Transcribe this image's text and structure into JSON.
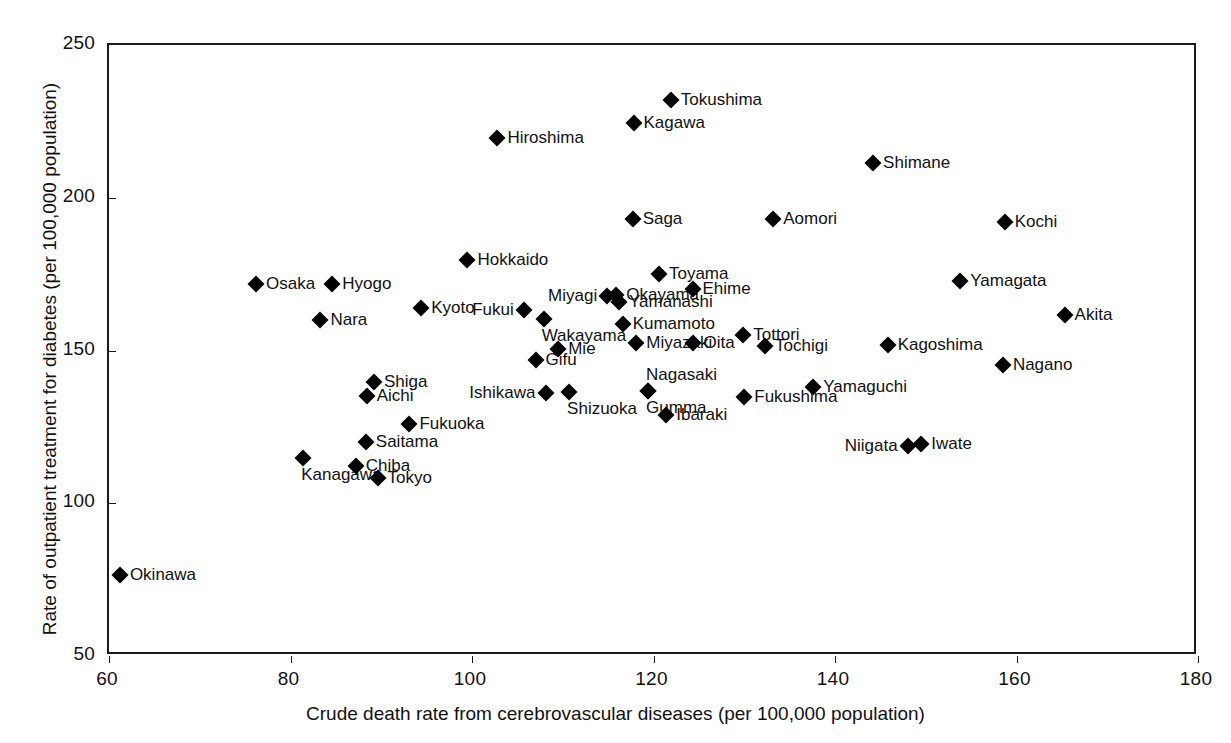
{
  "chart_data": {
    "type": "scatter",
    "title": "",
    "xlabel": "Crude death rate from cerebrovascular diseases (per 100,000 population)",
    "ylabel": "Rate of outpatient treatment for diabetes (per 100,000 population)",
    "xlim": [
      60,
      180
    ],
    "ylim": [
      50,
      250
    ],
    "xticks": [
      60,
      80,
      100,
      120,
      140,
      160,
      180
    ],
    "yticks": [
      50,
      100,
      150,
      200,
      250
    ],
    "xtick_labels": [
      "60",
      "80",
      "100",
      "120",
      "140",
      "160",
      "180"
    ],
    "ytick_labels": [
      "50",
      "100",
      "150",
      "200",
      "250"
    ],
    "grid": false,
    "legend": false,
    "marker": "diamond",
    "marker_color": "#000000",
    "points": [
      {
        "label": "Okinawa",
        "x": 61.2,
        "y": 76.6,
        "pos": "right"
      },
      {
        "label": "Osaka",
        "x": 76.2,
        "y": 171.9,
        "pos": "right"
      },
      {
        "label": "Kanagawa",
        "x": 81.4,
        "y": 114.7,
        "pos": "below"
      },
      {
        "label": "Nara",
        "x": 83.3,
        "y": 159.9,
        "pos": "right"
      },
      {
        "label": "Hyogo",
        "x": 84.6,
        "y": 171.9,
        "pos": "right"
      },
      {
        "label": "Chiba",
        "x": 87.2,
        "y": 112.1,
        "pos": "right"
      },
      {
        "label": "Aichi",
        "x": 88.4,
        "y": 135.0,
        "pos": "right"
      },
      {
        "label": "Shiga",
        "x": 89.2,
        "y": 139.6,
        "pos": "right"
      },
      {
        "label": "Saitama",
        "x": 88.3,
        "y": 119.9,
        "pos": "right"
      },
      {
        "label": "Tokyo",
        "x": 89.6,
        "y": 108.2,
        "pos": "right"
      },
      {
        "label": "Kyoto",
        "x": 94.4,
        "y": 163.8,
        "pos": "right"
      },
      {
        "label": "Fukuoka",
        "x": 93.1,
        "y": 125.9,
        "pos": "right"
      },
      {
        "label": "Hokkaido",
        "x": 99.5,
        "y": 179.7,
        "pos": "right"
      },
      {
        "label": "Hiroshima",
        "x": 102.8,
        "y": 219.6,
        "pos": "right"
      },
      {
        "label": "Fukui",
        "x": 105.7,
        "y": 163.2,
        "pos": "left"
      },
      {
        "label": "Ishikawa",
        "x": 108.1,
        "y": 136.0,
        "pos": "left"
      },
      {
        "label": "Wakayama",
        "x": 107.9,
        "y": 160.2,
        "pos": "below"
      },
      {
        "label": "Gifu",
        "x": 107.0,
        "y": 146.8,
        "pos": "right"
      },
      {
        "label": "Mie",
        "x": 109.5,
        "y": 150.4,
        "pos": "right"
      },
      {
        "label": "Shizuoka",
        "x": 110.7,
        "y": 136.3,
        "pos": "below"
      },
      {
        "label": "Miyagi",
        "x": 114.9,
        "y": 168.0,
        "pos": "left"
      },
      {
        "label": "Okayama",
        "x": 115.9,
        "y": 168.2,
        "pos": "right"
      },
      {
        "label": "Yamanashi",
        "x": 116.2,
        "y": 165.9,
        "pos": "right"
      },
      {
        "label": "Kumamoto",
        "x": 116.6,
        "y": 158.7,
        "pos": "right"
      },
      {
        "label": "Saga",
        "x": 117.7,
        "y": 193.0,
        "pos": "right"
      },
      {
        "label": "Kagawa",
        "x": 117.8,
        "y": 224.6,
        "pos": "right"
      },
      {
        "label": "Miyazaki",
        "x": 118.1,
        "y": 152.3,
        "pos": "right"
      },
      {
        "label": "Nagasaki",
        "x": 119.4,
        "y": 136.6,
        "pos": "above"
      },
      {
        "label": "Gumma",
        "x": 119.4,
        "y": 136.6,
        "pos": "below"
      },
      {
        "label": "Toyama",
        "x": 120.6,
        "y": 175.1,
        "pos": "right"
      },
      {
        "label": "Tokushima",
        "x": 121.9,
        "y": 232.0,
        "pos": "right"
      },
      {
        "label": "Ibaraki",
        "x": 121.4,
        "y": 129.0,
        "pos": "right"
      },
      {
        "label": "Ehime",
        "x": 124.3,
        "y": 170.1,
        "pos": "right"
      },
      {
        "label": "Oita",
        "x": 124.4,
        "y": 152.3,
        "pos": "right"
      },
      {
        "label": "Tottori",
        "x": 129.9,
        "y": 155.2,
        "pos": "right"
      },
      {
        "label": "Fukushima",
        "x": 130.0,
        "y": 134.7,
        "pos": "right"
      },
      {
        "label": "Tochigi",
        "x": 132.3,
        "y": 151.4,
        "pos": "right"
      },
      {
        "label": "Aomori",
        "x": 133.2,
        "y": 193.0,
        "pos": "right"
      },
      {
        "label": "Yamaguchi",
        "x": 137.6,
        "y": 138.0,
        "pos": "right"
      },
      {
        "label": "Shimane",
        "x": 144.2,
        "y": 211.4,
        "pos": "right"
      },
      {
        "label": "Kagoshima",
        "x": 145.8,
        "y": 151.8,
        "pos": "right"
      },
      {
        "label": "Niigata",
        "x": 148.0,
        "y": 118.6,
        "pos": "left"
      },
      {
        "label": "Iwate",
        "x": 149.5,
        "y": 119.3,
        "pos": "right"
      },
      {
        "label": "Nagano",
        "x": 158.5,
        "y": 145.1,
        "pos": "right"
      },
      {
        "label": "Kochi",
        "x": 158.7,
        "y": 192.0,
        "pos": "right"
      },
      {
        "label": "Yamagata",
        "x": 153.8,
        "y": 172.9,
        "pos": "right"
      },
      {
        "label": "Akita",
        "x": 165.3,
        "y": 161.5,
        "pos": "right"
      }
    ]
  }
}
